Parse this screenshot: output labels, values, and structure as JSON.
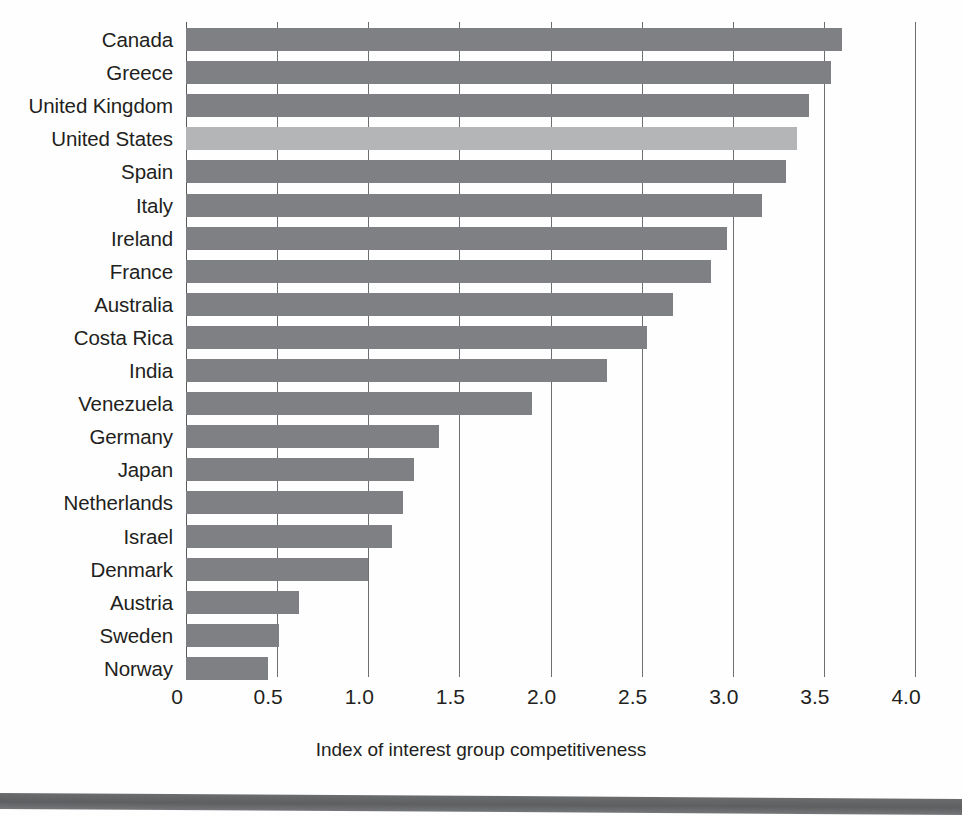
{
  "chart_data": {
    "type": "bar",
    "orientation": "horizontal",
    "title": "",
    "xlabel": "Index of interest group competitiveness",
    "ylabel": "",
    "xlim": [
      0,
      4.0
    ],
    "xticks": [
      "0",
      "0.5",
      "1.0",
      "1.5",
      "2.0",
      "2.5",
      "3.0",
      "3.5",
      "4.0"
    ],
    "xtick_values": [
      0,
      0.5,
      1.0,
      1.5,
      2.0,
      2.5,
      3.0,
      3.5,
      4.0
    ],
    "grid": "vertical",
    "legend": "none",
    "categories": [
      "Canada",
      "Greece",
      "United Kingdom",
      "United States",
      "Spain",
      "Italy",
      "Ireland",
      "France",
      "Australia",
      "Costa Rica",
      "India",
      "Venezuela",
      "Germany",
      "Japan",
      "Netherlands",
      "Israel",
      "Denmark",
      "Austria",
      "Sweden",
      "Norway"
    ],
    "values": [
      3.6,
      3.54,
      3.42,
      3.35,
      3.29,
      3.16,
      2.97,
      2.88,
      2.67,
      2.53,
      2.31,
      1.9,
      1.39,
      1.25,
      1.19,
      1.13,
      1.0,
      0.62,
      0.51,
      0.45
    ],
    "highlighted_category": "United States",
    "colors": {
      "bar": "#7f8083",
      "bar_highlight": "#b4b5b7",
      "gridline": "#6d6e71",
      "axis": "#58595b",
      "text": "#231f20",
      "footer_rule": "#65666a",
      "background": "#fefefe"
    }
  }
}
